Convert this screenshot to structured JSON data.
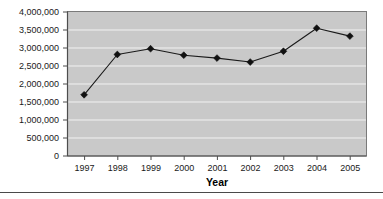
{
  "chart_data": {
    "type": "line",
    "title": "",
    "subtitle": "",
    "xlabel": "Year",
    "ylabel": "",
    "categories": [
      "1997",
      "1998",
      "1999",
      "2000",
      "2001",
      "2002",
      "2003",
      "2004",
      "2005"
    ],
    "values": [
      1700000,
      2820000,
      2980000,
      2800000,
      2720000,
      2610000,
      2910000,
      3550000,
      3330000
    ],
    "series": [
      {
        "name": "",
        "values": [
          1700000,
          2820000,
          2980000,
          2800000,
          2720000,
          2610000,
          2910000,
          3550000,
          3330000
        ]
      }
    ],
    "ylim": [
      0,
      4000000
    ],
    "ytick_labels": [
      "0",
      "500,000",
      "1,000,000",
      "1,500,000",
      "2,000,000",
      "2,500,000",
      "3,000,000",
      "3,500,000",
      "4,000,000"
    ],
    "ytick_values": [
      0,
      500000,
      1000000,
      1500000,
      2000000,
      2500000,
      3000000,
      3500000,
      4000000
    ],
    "xtick_labels": [
      "1997",
      "1998",
      "1999",
      "2000",
      "2001",
      "2002",
      "2003",
      "2004",
      "2005"
    ],
    "grid": true,
    "grid_axis": "y",
    "legend": false,
    "legend_position": "none",
    "marker": "diamond",
    "colors": {
      "line": "#1a1a1a",
      "marker": "#111111",
      "plot_background": "#c9c9c9",
      "gridline": "#f2f2f2",
      "frame": "#7a7a7a",
      "text": "#1a1a1a"
    }
  }
}
